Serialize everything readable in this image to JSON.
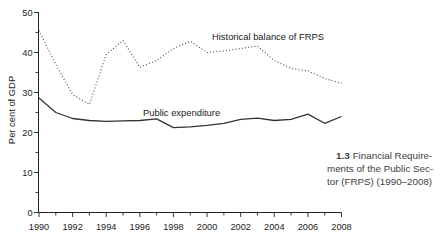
{
  "figure": {
    "caption": {
      "number": "1.3",
      "line1": "Financial Require-",
      "line2": "ments of the Public Sec-",
      "line3": "tor (FRPS) (1990–2008)"
    }
  },
  "chart_data": {
    "type": "line",
    "title": "",
    "xlabel": "",
    "ylabel": "Per cent of GDP",
    "xlim": [
      1990,
      2008
    ],
    "ylim": [
      0,
      50
    ],
    "grid": false,
    "legend": "inline-labels",
    "x_major_ticks": [
      1990,
      1992,
      1994,
      1996,
      1998,
      2000,
      2002,
      2004,
      2006,
      2008
    ],
    "x_minor_ticks": [
      1991,
      1993,
      1995,
      1997,
      1999,
      2001,
      2003,
      2005,
      2007
    ],
    "y_major_ticks": [
      0,
      10,
      20,
      30,
      40,
      50
    ],
    "y_minor_ticks": [
      5,
      15,
      25,
      35,
      45
    ],
    "x": [
      1990,
      1991,
      1992,
      1993,
      1994,
      1995,
      1996,
      1997,
      1998,
      1999,
      2000,
      2001,
      2002,
      2003,
      2004,
      2005,
      2006,
      2007,
      2008
    ],
    "series": [
      {
        "name": "Historical balance of FRPS",
        "style": "dotted",
        "color": "#4a4a4a",
        "values": [
          45.5,
          37.0,
          29.5,
          27.0,
          39.5,
          43.0,
          36.3,
          38.0,
          41.0,
          42.8,
          40.0,
          40.4,
          41.0,
          41.6,
          38.0,
          36.0,
          35.4,
          33.5,
          32.3
        ]
      },
      {
        "name": "Public expenditure",
        "style": "solid",
        "color": "#333333",
        "values": [
          28.6,
          25.0,
          23.5,
          23.0,
          22.8,
          22.9,
          23.0,
          23.4,
          21.2,
          21.4,
          21.8,
          22.3,
          23.3,
          23.6,
          23.0,
          23.3,
          24.6,
          22.3,
          24.0
        ]
      }
    ],
    "axis_color": "#222222",
    "text_color": "#222222"
  }
}
